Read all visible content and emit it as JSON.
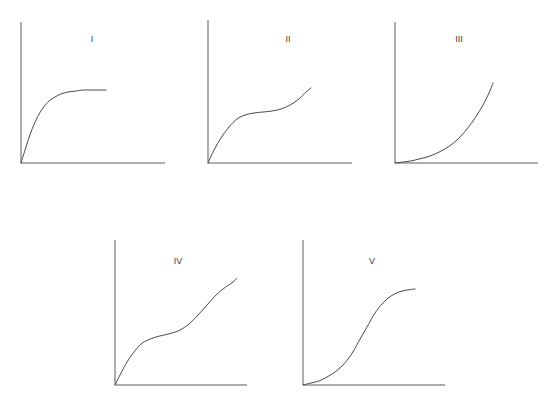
{
  "figure": {
    "title": "",
    "background_color": "#ffffff",
    "axis_color": "#5a5a5a",
    "curve_color": "#4a4a4a",
    "label_color": "#3b3b3b",
    "width": 556,
    "height": 395
  },
  "chart_data": {
    "type": "line",
    "title": "",
    "xlabel": "",
    "ylabel": "",
    "grid": false,
    "legend": "none",
    "panels": [
      {
        "id": "panel-1",
        "label": "I",
        "label_x": 92,
        "label_y": 40,
        "shape": "saturating-rise-plateau",
        "axes": {
          "origin_x": 21,
          "origin_y": 163,
          "y_top": 22,
          "x_right": 165
        },
        "x": [
          0,
          5,
          10,
          16,
          22,
          28,
          34,
          40,
          47,
          55,
          62,
          70,
          78,
          85
        ],
        "y": [
          0,
          16,
          31,
          45,
          55,
          62,
          66,
          69,
          71,
          72,
          73,
          73,
          73,
          73
        ],
        "xlim": [
          0,
          144
        ],
        "ylim": [
          0,
          141
        ]
      },
      {
        "id": "panel-2",
        "label": "II",
        "label_x": 288,
        "label_y": 40,
        "shape": "rise-plateau-rise",
        "axes": {
          "origin_x": 208,
          "origin_y": 163,
          "y_top": 20,
          "x_right": 352
        },
        "x": [
          0,
          6,
          13,
          21,
          29,
          37,
          46,
          55,
          64,
          73,
          82,
          91,
          98,
          103
        ],
        "y": [
          0,
          13,
          25,
          36,
          44,
          48,
          50,
          51,
          52,
          54,
          58,
          64,
          71,
          75
        ],
        "xlim": [
          0,
          144
        ],
        "ylim": [
          0,
          143
        ]
      },
      {
        "id": "panel-3",
        "label": "III",
        "label_x": 459,
        "label_y": 40,
        "shape": "exponential-rise",
        "axes": {
          "origin_x": 395,
          "origin_y": 163,
          "y_top": 22,
          "x_right": 538
        },
        "x": [
          0,
          8,
          16,
          24,
          32,
          40,
          48,
          56,
          64,
          72,
          80,
          88,
          94,
          98
        ],
        "y": [
          0,
          1,
          2,
          4,
          6,
          9,
          13,
          18,
          25,
          34,
          45,
          58,
          70,
          80
        ],
        "xlim": [
          0,
          143
        ],
        "ylim": [
          0,
          141
        ]
      },
      {
        "id": "panel-4",
        "label": "IV",
        "label_x": 178,
        "label_y": 262,
        "shape": "rise-plateau-rise-steeper",
        "axes": {
          "origin_x": 115,
          "origin_y": 385,
          "y_top": 240,
          "x_right": 247
        },
        "x": [
          0,
          6,
          12,
          19,
          26,
          33,
          41,
          49,
          57,
          65,
          74,
          83,
          92,
          100,
          108,
          118,
          122
        ],
        "y": [
          0,
          12,
          23,
          33,
          41,
          45,
          48,
          50,
          52,
          55,
          61,
          70,
          80,
          89,
          96,
          103,
          107
        ],
        "xlim": [
          0,
          132
        ],
        "ylim": [
          0,
          145
        ]
      },
      {
        "id": "panel-5",
        "label": "V",
        "label_x": 372,
        "label_y": 262,
        "shape": "sigmoid-s-curve",
        "axes": {
          "origin_x": 303,
          "origin_y": 385,
          "y_top": 240,
          "x_right": 445
        },
        "x": [
          0,
          8,
          16,
          24,
          32,
          40,
          48,
          56,
          64,
          72,
          80,
          88,
          96,
          104,
          112
        ],
        "y": [
          0,
          2,
          4,
          8,
          13,
          20,
          30,
          44,
          58,
          72,
          82,
          89,
          93,
          95,
          96
        ],
        "xlim": [
          0,
          142
        ],
        "ylim": [
          0,
          145
        ]
      }
    ]
  }
}
